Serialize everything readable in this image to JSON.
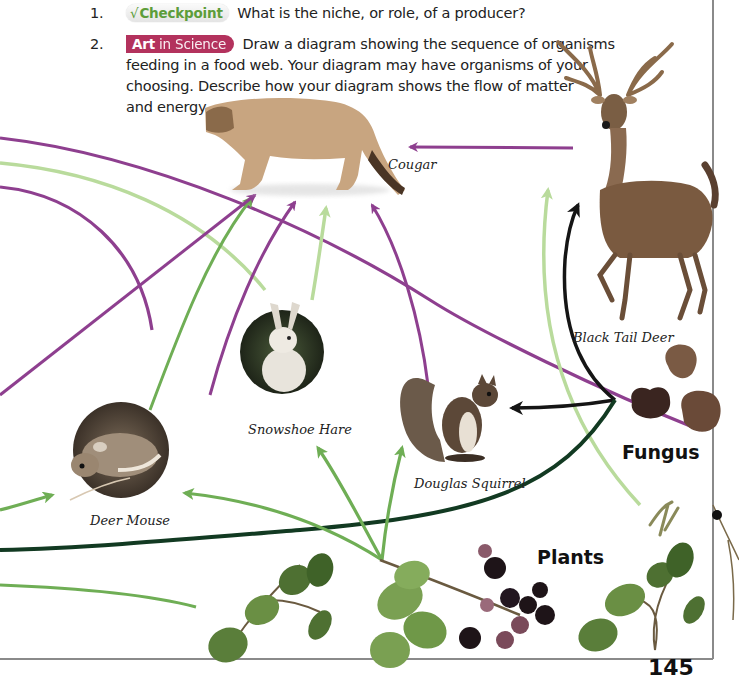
{
  "questions": [
    {
      "number": "1.",
      "badge": {
        "type": "checkpoint",
        "icon": "checkmark-icon",
        "icon_glyph": "√",
        "label": "Checkpoint",
        "color": "#5d9d3a"
      },
      "text": "What is the niche, or role, of a producer?"
    },
    {
      "number": "2.",
      "badge": {
        "type": "art-in-science",
        "label_bold": "Art",
        "label_rest": " in Science",
        "color": "#b3325d"
      },
      "lines": [
        "Draw a diagram showing the sequence of organisms",
        "feeding in a food web. Your diagram may have organisms of your",
        "choosing. Describe how your diagram shows the flow of matter",
        "and energy."
      ]
    }
  ],
  "food_web": {
    "organisms": [
      {
        "id": "cougar",
        "label": "Cougar"
      },
      {
        "id": "black-tail-deer",
        "label": "Black Tail Deer"
      },
      {
        "id": "snowshoe-hare",
        "label": "Snowshoe Hare"
      },
      {
        "id": "douglas-squirrel",
        "label": "Douglas Squirrel"
      },
      {
        "id": "deer-mouse",
        "label": "Deer Mouse"
      }
    ],
    "groups": {
      "fungus": "Fungus",
      "plants": "Plants"
    },
    "arrow_colors": {
      "purple": "#8e3f8f",
      "light_green": "#b9db9c",
      "green": "#6fae55",
      "black": "#151515",
      "dark_green": "#123a22"
    }
  },
  "page_number": "145"
}
